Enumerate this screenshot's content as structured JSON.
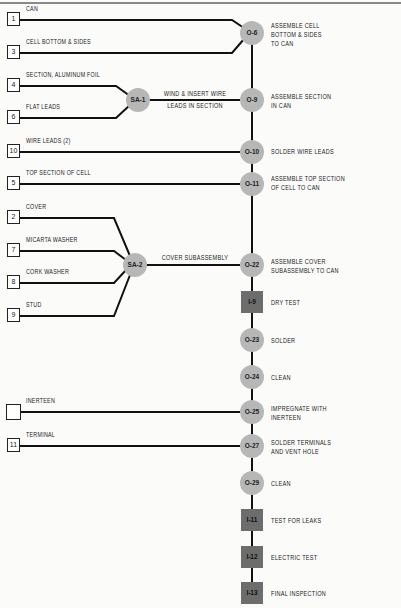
{
  "inputs": [
    {
      "number": "1",
      "label": "CAN"
    },
    {
      "number": "3",
      "label": "CELL BOTTOM & SIDES"
    },
    {
      "number": "4",
      "label": "SECTION, ALUMINUM FOIL"
    },
    {
      "number": "6",
      "label": "FLAT LEADS"
    },
    {
      "number": "10",
      "label": "WIRE LEADS (2)"
    },
    {
      "number": "5",
      "label": "TOP SECTION OF CELL"
    },
    {
      "number": "2",
      "label": "COVER"
    },
    {
      "number": "7",
      "label": "MICARTA WASHER"
    },
    {
      "number": "8",
      "label": "CORK WASHER"
    },
    {
      "number": "9",
      "label": "STUD"
    },
    {
      "number": "",
      "label": "INERTEEN"
    },
    {
      "number": "11",
      "label": "TERMINAL"
    }
  ],
  "subassemblies": [
    {
      "id": "SA-1",
      "label": "WIND & INSERT WIRE\nLEADS IN SECTION"
    },
    {
      "id": "SA-2",
      "label": "COVER SUBASSEMBLY"
    }
  ],
  "steps": [
    {
      "id": "O-6",
      "type": "operation",
      "label": "ASSEMBLE CELL\nBOTTOM & SIDES\nTO CAN"
    },
    {
      "id": "O-9",
      "type": "operation",
      "label": "ASSEMBLE SECTION\nIN CAN"
    },
    {
      "id": "O-10",
      "type": "operation",
      "label": "SOLDER WIRE LEADS"
    },
    {
      "id": "O-11",
      "type": "operation",
      "label": "ASSEMBLE TOP SECTION\nOF CELL TO CAN"
    },
    {
      "id": "O-22",
      "type": "operation",
      "label": "ASSEMBLE COVER\nSUBASSEMBLY TO CAN"
    },
    {
      "id": "I-9",
      "type": "inspection",
      "label": "DRY TEST"
    },
    {
      "id": "O-23",
      "type": "operation",
      "label": "SOLDER"
    },
    {
      "id": "O-24",
      "type": "operation",
      "label": "CLEAN"
    },
    {
      "id": "O-25",
      "type": "operation",
      "label": "IMPREGNATE WITH\nINERTEEN"
    },
    {
      "id": "O-27",
      "type": "operation",
      "label": "SOLDER TERMINALS\nAND VENT HOLE"
    },
    {
      "id": "O-29",
      "type": "operation",
      "label": "CLEAN"
    },
    {
      "id": "I-11",
      "type": "inspection",
      "label": "TEST FOR LEAKS"
    },
    {
      "id": "I-12",
      "type": "inspection",
      "label": "ELECTRIC TEST"
    },
    {
      "id": "I-13",
      "type": "inspection",
      "label": "FINAL INSPECTION"
    }
  ],
  "colors": {
    "operation_fill": "#b7b7b7",
    "inspection_fill": "#6d6d6d",
    "line": "#111111"
  }
}
